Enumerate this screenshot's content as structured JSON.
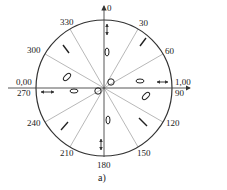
{
  "figure": {
    "caption": "a)",
    "colors": {
      "stroke": "#333333",
      "thin": "#888888",
      "text": "#222222",
      "background": "#ffffff"
    },
    "circle": {
      "cx": 104,
      "cy": 88,
      "r": 68
    },
    "axis_labels": {
      "top": "0",
      "right_upper": "1,00",
      "right_lower": "90",
      "left_upper": "0,00",
      "left_lower": "270",
      "bottom": "180"
    },
    "angle_labels": [
      {
        "angle": 30,
        "text": "30"
      },
      {
        "angle": 60,
        "text": "60"
      },
      {
        "angle": 120,
        "text": "120"
      },
      {
        "angle": 150,
        "text": "150"
      },
      {
        "angle": 210,
        "text": "210"
      },
      {
        "angle": 240,
        "text": "240"
      },
      {
        "angle": 300,
        "text": "300"
      },
      {
        "angle": 330,
        "text": "330"
      }
    ],
    "radial_angles": [
      30,
      60,
      120,
      150,
      210,
      240,
      300,
      330
    ],
    "symbols": [
      {
        "type": "double-arrow-vertical",
        "sector": "0"
      },
      {
        "type": "ellipse-vertical",
        "sector": "0-upper-inner"
      },
      {
        "type": "bar-diagonal",
        "sector": "30-60"
      },
      {
        "type": "ellipse-horizontal",
        "sector": "90-inner"
      },
      {
        "type": "double-arrow-horizontal",
        "sector": "90"
      },
      {
        "type": "ellipse-tilted",
        "sector": "90-120"
      },
      {
        "type": "bar-diagonal",
        "sector": "120-150"
      },
      {
        "type": "ellipse-vertical",
        "sector": "180-inner"
      },
      {
        "type": "double-arrow-vertical",
        "sector": "180"
      },
      {
        "type": "bar-diagonal",
        "sector": "210-240"
      },
      {
        "type": "ellipse-horizontal",
        "sector": "270-inner"
      },
      {
        "type": "double-arrow-horizontal",
        "sector": "270"
      },
      {
        "type": "ellipse-tilted",
        "sector": "270-300"
      },
      {
        "type": "bar-diagonal",
        "sector": "300-330"
      },
      {
        "type": "small-circle",
        "sector": "center-upper-right"
      },
      {
        "type": "small-circle",
        "sector": "center-lower-left"
      }
    ]
  }
}
